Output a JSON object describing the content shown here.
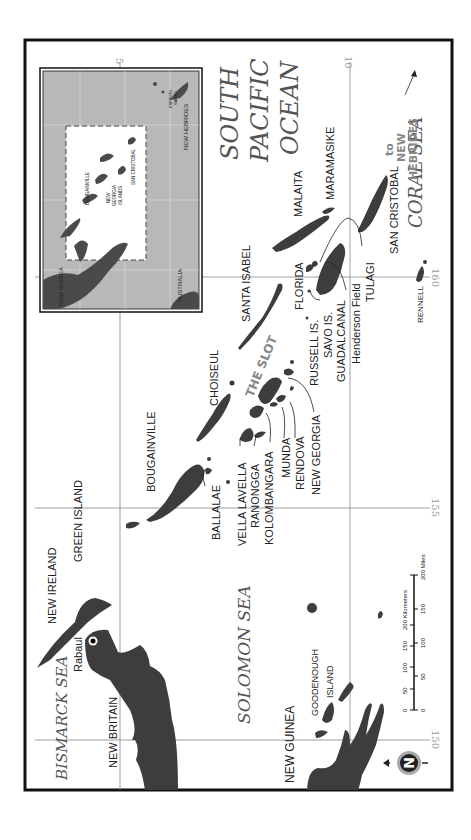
{
  "map": {
    "orientation": "rotated 90 degrees clockwise",
    "colors": {
      "land": "#3d3d3d",
      "inset_water": "#b8b8b8",
      "grid": "#888888",
      "frame": "#111111",
      "sea_label": "#555555",
      "slot_label": "#888888"
    },
    "grid_labels": {
      "lat_5": "5",
      "lat_10": "10",
      "lon_150": "150",
      "lon_155": "155",
      "lon_160": "160"
    },
    "seas": {
      "bismarck": "BISMARCK SEA",
      "solomon": "SOLOMON SEA",
      "south_pacific_1": "SOUTH",
      "south_pacific_2": "PACIFIC",
      "south_pacific_3": "OCEAN",
      "coral": "CORAL SEA"
    },
    "places": {
      "new_britain": "NEW BRITAIN",
      "new_ireland": "NEW IRELAND",
      "rabaul": "Rabaul",
      "green_island": "GREEN ISLAND",
      "bougainville": "BOUGAINVILLE",
      "ballalae": "BALLALAE",
      "choiseul": "CHOISEUL",
      "vella_lavella": "VELLA LAVELLA",
      "ranongga": "RANONGGA",
      "kolombangara": "KOLOMBANGARA",
      "munda": "MUNDA",
      "rendova": "RENDOVA",
      "new_georgia": "NEW GEORGIA",
      "santa_isabel": "SANTA ISABEL",
      "the_slot": "THE SLOT",
      "russell": "RUSSELL IS.",
      "savo": "SAVO IS.",
      "guadalcanal": "GUADALCANAL",
      "henderson": "Henderson Field",
      "florida": "FLORIDA",
      "tulagi": "TULAGI",
      "malaita": "MALAITA",
      "maramasike": "MARAMASIKE",
      "san_cristobal": "SAN CRISTOBAL",
      "rennell": "RENNELL",
      "new_guinea": "NEW GUINEA",
      "goodenough_1": "GOODENOUGH",
      "goodenough_2": "ISLAND",
      "to_nh_1": "to",
      "to_nh_2": "NEW",
      "to_nh_3": "HEBRIDES"
    },
    "inset": {
      "new_guinea": "NEW GUINEA",
      "australia": "AUSTRALIA",
      "bougainville": "BOUGAINVILLE",
      "new_georgia_1": "NEW",
      "new_georgia_2": "GEORGIA",
      "new_georgia_3": "ISLANDS",
      "san_cristobal": "SAN CRISTOBAL",
      "espiritu_1": "ESPIRITU",
      "espiritu_2": "SANTO",
      "new_hebrides": "NEW HEBRIDES"
    },
    "scale_bar": {
      "km_ticks": [
        "0",
        "50",
        "100",
        "150",
        "200 Kilometers"
      ],
      "mi_ticks": [
        "0",
        "50",
        "100",
        "150",
        "200 Miles"
      ]
    },
    "compass": {
      "letter": "N"
    }
  }
}
